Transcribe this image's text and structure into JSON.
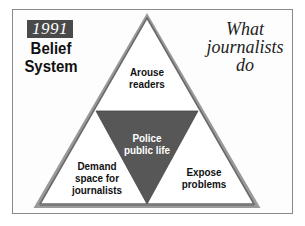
{
  "header": {
    "year": "1991",
    "title": "Belief System",
    "title_line1": "Belief",
    "title_line2": "System",
    "subtitle": "What journalists do",
    "subtitle_line1": "What",
    "subtitle_line2": "journalists",
    "subtitle_line3": "do"
  },
  "triangle": {
    "top": {
      "line1": "Arouse",
      "line2": "readers"
    },
    "center": {
      "line1": "Police",
      "line2": "public life"
    },
    "bottom_left": {
      "line1": "Demand",
      "line2": "space for",
      "line3": "journalists"
    },
    "bottom_right": {
      "line1": "Expose",
      "line2": "problems"
    }
  },
  "colors": {
    "year_box": "#4a4a4a",
    "center_triangle": "#555555",
    "outline": "#777777",
    "frame_border": "#8a8a8a"
  }
}
